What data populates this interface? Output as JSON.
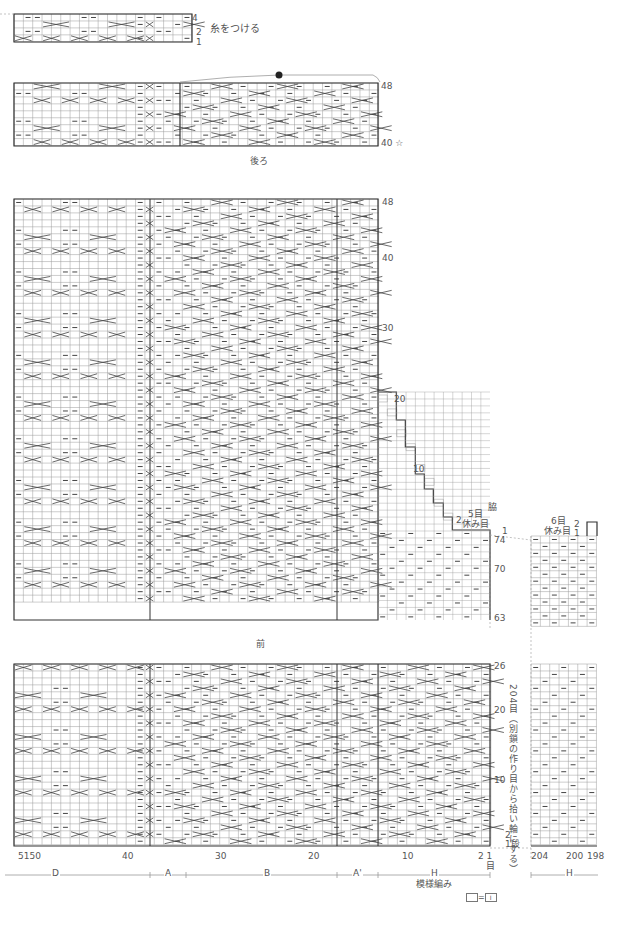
{
  "colors": {
    "grid": "#9a9a9a",
    "bold": "#333333",
    "symbol": "#444444",
    "text": "#555555",
    "dot": "#222222"
  },
  "back_chart": {
    "title": "後ろ",
    "attach_yarn_label": "糸をつける",
    "row_labels": {
      "top": "48",
      "bottom": "40 ☆"
    },
    "small_block_rows": {
      "top": "4",
      "r2": "2",
      "r1": "1"
    }
  },
  "front_chart": {
    "title": "前",
    "row_labels_upper": [
      "48",
      "40",
      "30",
      "20",
      "10"
    ],
    "row_labels_lower_right": [
      "74",
      "70",
      "63"
    ],
    "row_labels_bottom": [
      "26",
      "20",
      "10"
    ],
    "side_label": "脇",
    "rest_left": {
      "count": "5目",
      "text": "休み目",
      "row": "2",
      "row1": "1"
    },
    "rest_right": {
      "count": "6目",
      "text": "休み目",
      "row2": "2",
      "row1": "1"
    },
    "pickup_note": "204目（別鎖の作り目から拾い輪にする）",
    "bottom_rows": {
      "r2": "2",
      "r1": "1段"
    }
  },
  "stitch_axis": {
    "labels_left": [
      "5150",
      "40",
      "30",
      "20",
      "10",
      "2 1"
    ],
    "label_first_unit": "目",
    "labels_right": [
      "204",
      "200",
      "198"
    ]
  },
  "sections": {
    "left": [
      "D",
      "A",
      "B",
      "A'",
      "H"
    ],
    "right": [
      "H"
    ]
  },
  "legend": {
    "pattern_name": "模様編み",
    "key": "□=□I"
  }
}
